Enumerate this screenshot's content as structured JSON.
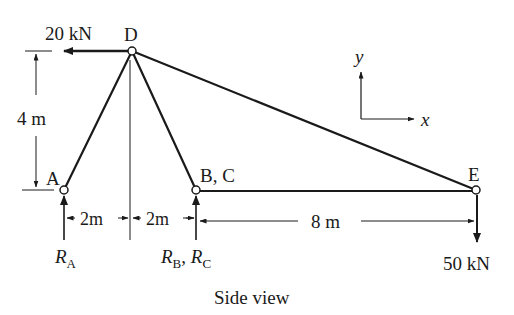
{
  "figure": {
    "caption": "Side view",
    "colors": {
      "ink": "#1a1a1a",
      "background": "#ffffff"
    }
  },
  "joints": {
    "A": {
      "label": "A"
    },
    "BC": {
      "label": "B, C"
    },
    "D": {
      "label": "D"
    },
    "E": {
      "label": "E"
    }
  },
  "loads": {
    "at_D": {
      "value": "20 kN",
      "direction": "left"
    },
    "at_E": {
      "value": "50 kN",
      "direction": "down"
    }
  },
  "reactions": {
    "A": {
      "symbol": "R",
      "subscript": "A"
    },
    "BC": {
      "symbol1": "R",
      "subscript1": "B",
      "sep": ", ",
      "symbol2": "R",
      "subscript2": "C"
    }
  },
  "dimensions": {
    "height": "4 m",
    "AD_horizontal": "2m",
    "DB_horizontal": "2m",
    "BE_horizontal": "8 m"
  },
  "axes": {
    "x": "x",
    "y": "y"
  }
}
